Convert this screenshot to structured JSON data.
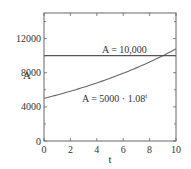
{
  "chart_data": {
    "type": "line",
    "title": "",
    "xlabel": "t",
    "ylabel": "A",
    "xlim": [
      0,
      10
    ],
    "ylim": [
      0,
      15000
    ],
    "grid": false,
    "legend": null,
    "x_ticks": [
      0,
      2,
      4,
      6,
      8,
      10
    ],
    "x_tick_labels": [
      "0",
      "2",
      "4",
      "6",
      "8",
      "10"
    ],
    "y_ticks_major": [
      0,
      4000,
      8000,
      12000
    ],
    "y_tick_labels": [
      "0",
      "4000",
      "8000",
      "12000"
    ],
    "y_ticks_minor": [
      2000,
      6000,
      10000,
      14000
    ],
    "series": [
      {
        "name": "A = 10,000",
        "kind": "constant",
        "value": 10000,
        "x": [
          0,
          10
        ],
        "y": [
          10000,
          10000
        ]
      },
      {
        "name": "A = 5000 · 1.08^t",
        "kind": "exponential",
        "a": 5000,
        "b": 1.08,
        "x": [
          0,
          1,
          2,
          3,
          4,
          5,
          6,
          7,
          8,
          9,
          10
        ],
        "y": [
          5000,
          5400,
          5832,
          6299,
          6802,
          7347,
          7934,
          8569,
          9255,
          9995,
          10795
        ]
      }
    ],
    "annotations": [
      {
        "text": "A = 10,000",
        "x": 6.0,
        "y": 10500
      },
      {
        "text": "A = 5000 · 1.08",
        "superscript": "t",
        "x": 5.0,
        "y": 6800
      }
    ],
    "intersection": {
      "t": 9.0,
      "A": 10000
    }
  },
  "colors": {
    "axes": "#555555",
    "line": "#555555",
    "text": "#333333",
    "background": "#ffffff"
  }
}
